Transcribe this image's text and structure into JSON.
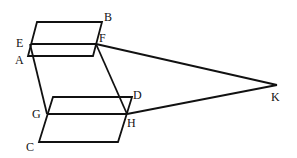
{
  "diagram": {
    "type": "geometry",
    "stroke_color": "#111111",
    "background": "#ffffff",
    "points": {
      "B": {
        "x": 102,
        "y": 22,
        "label": "B"
      },
      "E": {
        "x": 30,
        "y": 44,
        "label": "E"
      },
      "F": {
        "x": 96,
        "y": 44,
        "label": "F"
      },
      "A": {
        "x": 28,
        "y": 57,
        "label": "A"
      },
      "D": {
        "x": 132,
        "y": 97,
        "label": "D"
      },
      "G": {
        "x": 47,
        "y": 114,
        "label": "G"
      },
      "H": {
        "x": 127,
        "y": 114,
        "label": "H"
      },
      "C": {
        "x": 39,
        "y": 142,
        "label": "C"
      },
      "K": {
        "x": 277,
        "y": 85,
        "label": "K"
      }
    },
    "labels": {
      "A": "A",
      "B": "B",
      "C": "C",
      "D": "D",
      "E": "E",
      "F": "F",
      "G": "G",
      "H": "H",
      "K": "K"
    }
  }
}
